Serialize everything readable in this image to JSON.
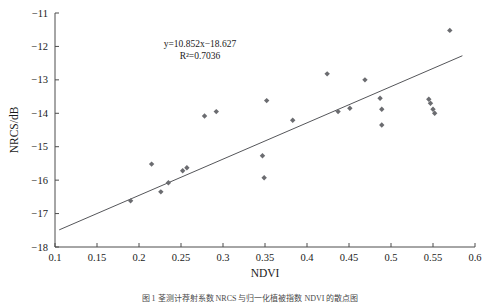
{
  "figure": {
    "axis_color": "#4d4d4d",
    "marker_color": "#6b6c70",
    "line_color": "#55565a"
  },
  "annotation": {
    "equation": "y=10.852x−18.627",
    "r_squared": "R²=0.7036"
  },
  "caption": {
    "text": "图 1   荃测计荐射系数 NRCS 与归一化植被指数 NDVI 的散点图"
  },
  "chart_data": {
    "type": "scatter",
    "title": "",
    "xlabel": "NDVI",
    "ylabel": "NRCS/dB",
    "xlim": [
      0.1,
      0.6
    ],
    "ylim": [
      -18,
      -11
    ],
    "xticks": [
      "0.1",
      "0.15",
      "0.2",
      "0.25",
      "0.3",
      "0.35",
      "0.4",
      "0.45",
      "0.5",
      "0.55",
      "0.6"
    ],
    "xtick_values": [
      0.1,
      0.15,
      0.2,
      0.25,
      0.3,
      0.35,
      0.4,
      0.45,
      0.5,
      0.55,
      0.6
    ],
    "yticks": [
      "−11",
      "−12",
      "−13",
      "−14",
      "−15",
      "−16",
      "−17",
      "−18"
    ],
    "ytick_values": [
      -11,
      -12,
      -13,
      -14,
      -15,
      -16,
      -17,
      -18
    ],
    "grid": false,
    "legend": null,
    "points": [
      {
        "x": 0.19,
        "y": -16.62
      },
      {
        "x": 0.215,
        "y": -15.52
      },
      {
        "x": 0.226,
        "y": -16.35
      },
      {
        "x": 0.235,
        "y": -16.08
      },
      {
        "x": 0.252,
        "y": -15.72
      },
      {
        "x": 0.257,
        "y": -15.63
      },
      {
        "x": 0.278,
        "y": -14.08
      },
      {
        "x": 0.292,
        "y": -13.95
      },
      {
        "x": 0.347,
        "y": -15.27
      },
      {
        "x": 0.349,
        "y": -15.93
      },
      {
        "x": 0.352,
        "y": -13.62
      },
      {
        "x": 0.383,
        "y": -14.21
      },
      {
        "x": 0.424,
        "y": -12.82
      },
      {
        "x": 0.437,
        "y": -13.95
      },
      {
        "x": 0.451,
        "y": -13.85
      },
      {
        "x": 0.469,
        "y": -13.0
      },
      {
        "x": 0.487,
        "y": -13.55
      },
      {
        "x": 0.489,
        "y": -13.88
      },
      {
        "x": 0.489,
        "y": -14.35
      },
      {
        "x": 0.545,
        "y": -13.58
      },
      {
        "x": 0.547,
        "y": -13.7
      },
      {
        "x": 0.55,
        "y": -13.88
      },
      {
        "x": 0.552,
        "y": -14.0
      },
      {
        "x": 0.57,
        "y": -11.52
      }
    ],
    "fit_line": {
      "slope": 10.852,
      "intercept": -18.627,
      "x_start": 0.105,
      "x_end": 0.585
    }
  }
}
